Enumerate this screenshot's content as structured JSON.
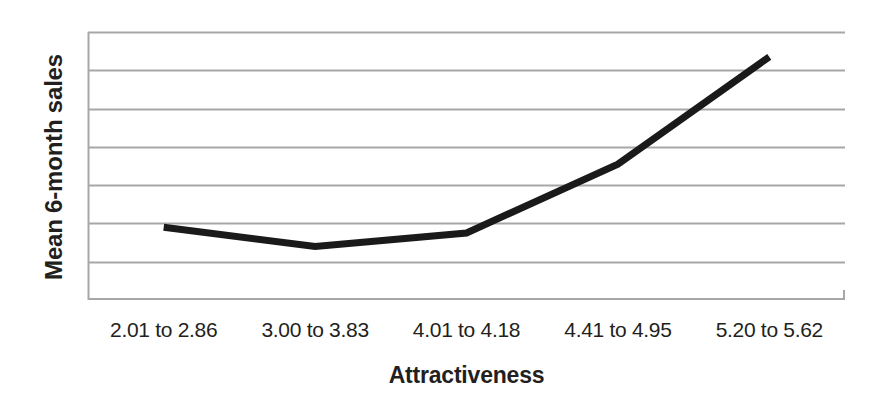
{
  "chart_data": {
    "type": "line",
    "title": "",
    "xlabel": "Attractiveness",
    "ylabel": "Mean 6-month sales",
    "categories": [
      "2.01 to 2.86",
      "3.00 to 3.83",
      "4.01 to 4.18",
      "4.41 to 4.95",
      "5.20 to 5.62"
    ],
    "series": [
      {
        "name": "Mean 6-month sales",
        "values": [
          1.9,
          1.4,
          1.75,
          3.55,
          6.35
        ],
        "color": "#1a1a1a"
      }
    ],
    "ylim": [
      0,
      7
    ],
    "yticks": [
      0,
      1,
      2,
      3,
      4,
      5,
      6,
      7
    ],
    "ytick_labels": [
      "",
      "",
      "",
      "",
      "",
      "",
      "",
      ""
    ],
    "grid": "horizontal",
    "gridline_count": 7,
    "gridline_color": "#a7a7a7",
    "axis_color": "#a7a7a7",
    "legend": "none",
    "line_width_px": 7,
    "background": "#ffffff"
  },
  "axes": {
    "x_title": "Attractiveness",
    "y_title": "Mean 6-month sales"
  }
}
